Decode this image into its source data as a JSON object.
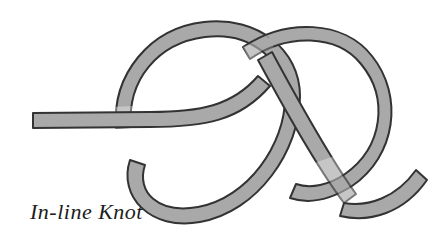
{
  "figure": {
    "caption": "In-line Knot",
    "colors": {
      "background": "#ffffff",
      "rope_fill": "#a9a9a9",
      "rope_outline": "#333333",
      "caption_text": "#1c1c1c"
    },
    "rope": {
      "band_width": 15,
      "outline_width": 2,
      "ends": [
        {
          "name": "left-tail-end",
          "x": 33,
          "y": 120,
          "cut": "flat-vertical"
        },
        {
          "name": "right-tail-end",
          "x": 424,
          "y": 176,
          "cut": "flat-angled"
        }
      ],
      "crossings": [
        {
          "name": "left-band-over-loop",
          "x": 120,
          "y": 122,
          "over": "horizontal-band"
        },
        {
          "name": "center-x-crossing",
          "x": 272,
          "y": 80,
          "over": "descending-diagonal"
        },
        {
          "name": "lower-right-crossing",
          "x": 340,
          "y": 190,
          "over": "right-loop"
        }
      ]
    }
  }
}
